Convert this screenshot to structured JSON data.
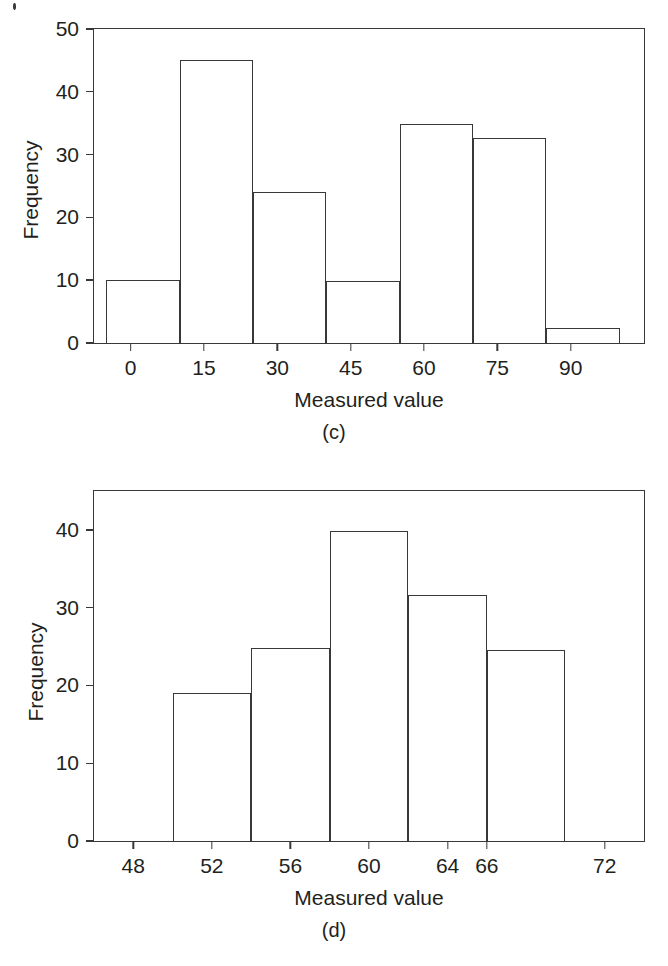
{
  "page": {
    "background": "#ffffff",
    "ink": "#231f20",
    "line_color": "#3a3738"
  },
  "figures": [
    {
      "caption": "(c)",
      "xlabel": "Measured value",
      "ylabel": "Frequency"
    },
    {
      "caption": "(d)",
      "xlabel": "Measured value",
      "ylabel": "Frequency"
    }
  ],
  "chart_data": [
    {
      "type": "bar",
      "title": "(c)",
      "xlabel": "Measured value",
      "ylabel": "Frequency",
      "grid": false,
      "legend": false,
      "xticklabels": [
        "0",
        "15",
        "30",
        "45",
        "60",
        "75",
        "90"
      ],
      "xtick_values": [
        0,
        15,
        30,
        45,
        60,
        75,
        90
      ],
      "yticklabels": [
        "0",
        "10",
        "20",
        "30",
        "40",
        "50"
      ],
      "ytick_values": [
        0,
        10,
        20,
        30,
        40,
        50
      ],
      "ylim": [
        0,
        50
      ],
      "xlim": [
        -7.5,
        105
      ],
      "bin_edges": [
        -5,
        10,
        25,
        40,
        55,
        70,
        85,
        100
      ],
      "categories": [
        "-5 to 10",
        "10 to 25",
        "25 to 40",
        "40 to 55",
        "55 to 70",
        "70 to 85",
        "85 to 100"
      ],
      "values": [
        10,
        45,
        24,
        9.8,
        34.8,
        32.6,
        2.4
      ]
    },
    {
      "type": "bar",
      "title": "(d)",
      "xlabel": "Measured value",
      "ylabel": "Frequency",
      "grid": false,
      "legend": false,
      "xticklabels": [
        "48",
        "52",
        "56",
        "60",
        "64",
        "66",
        "72"
      ],
      "xtick_values": [
        48,
        52,
        56,
        60,
        64,
        66,
        72
      ],
      "yticklabels": [
        "0",
        "10",
        "20",
        "30",
        "40"
      ],
      "ytick_values": [
        0,
        10,
        20,
        30,
        40
      ],
      "ylim": [
        0,
        45
      ],
      "xlim": [
        46,
        74
      ],
      "bin_edges": [
        50,
        54,
        58,
        62,
        66,
        70
      ],
      "categories": [
        "50 to 54",
        "54 to 58",
        "58 to 62",
        "62 to 66",
        "66 to 70"
      ],
      "values": [
        19,
        24.8,
        39.8,
        31.6,
        24.5
      ]
    }
  ]
}
